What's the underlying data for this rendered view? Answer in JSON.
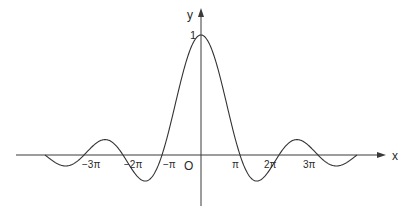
{
  "chart_data": {
    "type": "line",
    "title": "",
    "function": "y = sin(x)/x",
    "xlabel": "x",
    "ylabel": "y",
    "origin_label": "O",
    "x_range": [
      -12.566,
      12.566
    ],
    "ylim": [
      -0.3,
      1.0
    ],
    "grid": false,
    "legend": null,
    "x_ticks": [
      {
        "value": -9.4248,
        "label": "−3π"
      },
      {
        "value": -6.2832,
        "label": "−2π"
      },
      {
        "value": -3.1416,
        "label": "−π"
      },
      {
        "value": 3.1416,
        "label": "π"
      },
      {
        "value": 6.2832,
        "label": "2π"
      },
      {
        "value": 9.4248,
        "label": "3π"
      }
    ],
    "y_ticks": [
      {
        "value": 1,
        "label": "1"
      }
    ],
    "series": [
      {
        "name": "sin(x)/x",
        "color": "#333333",
        "points": [
          [
            -12.566,
            0.0
          ],
          [
            -10.904,
            -0.091
          ],
          [
            -9.425,
            0.0
          ],
          [
            -7.725,
            0.128
          ],
          [
            -6.283,
            0.0
          ],
          [
            -4.493,
            -0.217
          ],
          [
            -3.142,
            0.0
          ],
          [
            0.0,
            1.0
          ],
          [
            3.142,
            0.0
          ],
          [
            4.493,
            -0.217
          ],
          [
            6.283,
            0.0
          ],
          [
            7.725,
            0.128
          ],
          [
            9.425,
            0.0
          ],
          [
            10.904,
            -0.091
          ],
          [
            12.566,
            0.0
          ]
        ]
      }
    ]
  },
  "labels": {
    "x_axis": "x",
    "y_axis": "y",
    "origin": "O",
    "y_one": "1",
    "ticks": [
      "−3π",
      "−2π",
      "−π",
      "π",
      "2π",
      "3π"
    ]
  },
  "colors": {
    "axis": "#3a3a3a",
    "curve": "#333333",
    "text": "#2a2a2a",
    "background": "#ffffff"
  }
}
